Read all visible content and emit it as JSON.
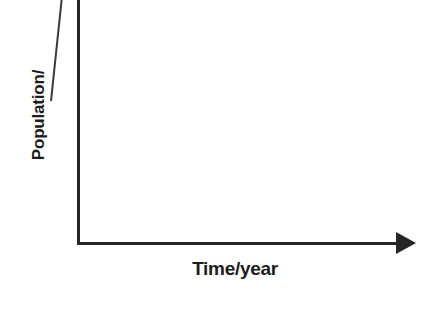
{
  "figure": {
    "background_color": "#ffffff",
    "ink_color": "#262626",
    "width": 427,
    "height": 322
  },
  "chart_data": {
    "type": "line",
    "title": "",
    "subtitle": "",
    "xlabel": "Time/year",
    "ylabel": "Population/",
    "x": [],
    "values": [],
    "series": [],
    "categories": [],
    "xtick_labels": [],
    "ytick_labels": [],
    "annotations": [],
    "legend": [],
    "legend_position": "none",
    "grid": false,
    "xlim": [
      0,
      0
    ],
    "ylim": [
      0,
      0
    ]
  },
  "axes": {
    "x": {
      "label": "Time/year",
      "arrow_head": "solid-triangle-right",
      "has_ticks": false
    },
    "y": {
      "label": "Population/",
      "arrow_head": "none",
      "has_ticks": false,
      "cropped_at_top": true
    }
  }
}
